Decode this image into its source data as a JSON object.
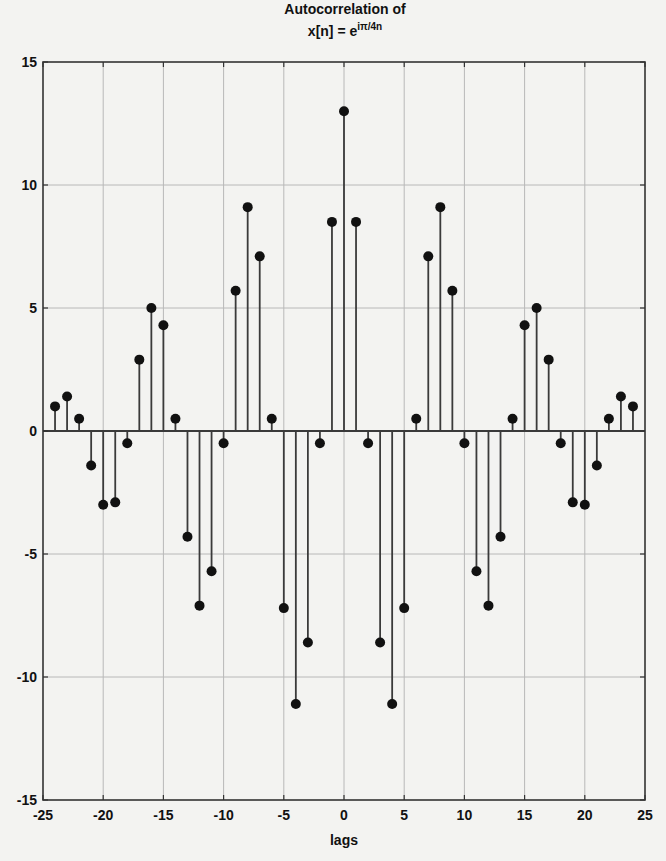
{
  "chart_data": {
    "type": "stem",
    "title": "Autocorrelation of",
    "title_line2": {
      "prefix": "x[n] = e",
      "superscript": "iπ/4n"
    },
    "xlabel": "lags",
    "ylabel": "",
    "xlim": [
      -25,
      25
    ],
    "ylim": [
      -15,
      15
    ],
    "xticks": [
      -25,
      -20,
      -15,
      -10,
      -5,
      0,
      5,
      10,
      15,
      20,
      25
    ],
    "yticks": [
      -15,
      -10,
      -5,
      0,
      5,
      10,
      15
    ],
    "grid": true,
    "legend": null,
    "x": [
      -24,
      -23,
      -22,
      -21,
      -20,
      -19,
      -18,
      -17,
      -16,
      -15,
      -14,
      -13,
      -12,
      -11,
      -10,
      -9,
      -8,
      -7,
      -6,
      -5,
      -4,
      -3,
      -2,
      -1,
      0,
      1,
      2,
      3,
      4,
      5,
      6,
      7,
      8,
      9,
      10,
      11,
      12,
      13,
      14,
      15,
      16,
      17,
      18,
      19,
      20,
      21,
      22,
      23,
      24
    ],
    "values": [
      1.0,
      1.4,
      0.5,
      -1.4,
      -3.0,
      -2.9,
      -0.5,
      2.9,
      5.0,
      4.3,
      0.5,
      -4.3,
      -7.1,
      -5.7,
      -0.5,
      5.7,
      9.1,
      7.1,
      0.5,
      -7.2,
      -11.1,
      -8.6,
      -0.5,
      8.5,
      13.0,
      8.5,
      -0.5,
      -8.6,
      -11.1,
      -7.2,
      0.5,
      7.1,
      9.1,
      5.7,
      -0.5,
      -5.7,
      -7.1,
      -4.3,
      0.5,
      4.3,
      5.0,
      2.9,
      -0.5,
      -2.9,
      -3.0,
      -1.4,
      0.5,
      1.4,
      1.0
    ]
  },
  "colors": {
    "background": "#f3f3f1",
    "axes": "#333333",
    "grid": "#b8b8b8",
    "stem": "#3a3a3a",
    "marker": "#111111",
    "text": "#111111"
  },
  "layout": {
    "plot_left": 43,
    "plot_right": 645,
    "plot_top": 62,
    "plot_bottom": 800
  }
}
